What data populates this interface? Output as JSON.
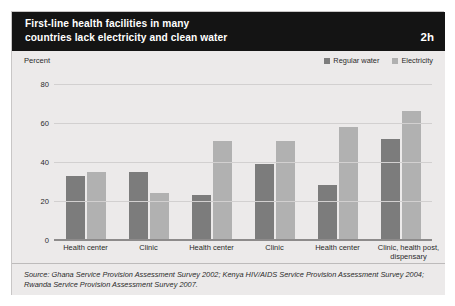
{
  "header": {
    "title_line1": "First-line health facilities in many",
    "title_line2": "countries lack electricity and clean water",
    "badge": "2h"
  },
  "axis": {
    "unit_label": "Percent",
    "yticks": [
      "80",
      "60",
      "40",
      "20",
      "0"
    ]
  },
  "legend": {
    "items": [
      {
        "label": "Regular water",
        "color": "#7c7c7c"
      },
      {
        "label": "Electricity",
        "color": "#b1b1b1"
      }
    ]
  },
  "source": {
    "text": "Source: Ghana Service Provision Assessment Survey 2002; Kenya HIV/AIDS Service Provision Assessment Survey 2004; Rwanda Service Provision Assessment Survey 2007."
  },
  "facility_labels": [
    "Health center",
    "Clinic",
    "Health center",
    "Clinic",
    "Health center",
    "Clinic, health post, dispensary"
  ],
  "group_labels": [
    {
      "country": "Ghana",
      "year": "(2002)"
    },
    {
      "country": "Kenya",
      "year": "(2004)"
    },
    {
      "country": "Rwanda",
      "year": "(2007)"
    }
  ],
  "chart_data": {
    "type": "bar",
    "title": "First-line health facilities in many countries lack electricity and clean water",
    "xlabel": "",
    "ylabel": "Percent",
    "ylim": [
      0,
      80
    ],
    "yticks": [
      0,
      20,
      40,
      60,
      80
    ],
    "grid": true,
    "legend_position": "top-right",
    "categories": [
      "Ghana (2002) - Health center",
      "Ghana (2002) - Clinic",
      "Kenya (2004) - Health center",
      "Kenya (2004) - Clinic",
      "Rwanda (2007) - Health center",
      "Rwanda (2007) - Clinic, health post, dispensary"
    ],
    "series": [
      {
        "name": "Regular water",
        "color": "#7c7c7c",
        "values": [
          33,
          35,
          23,
          39,
          28,
          52
        ]
      },
      {
        "name": "Electricity",
        "color": "#b1b1b1",
        "values": [
          35,
          24,
          51,
          51,
          58,
          66
        ]
      }
    ]
  }
}
